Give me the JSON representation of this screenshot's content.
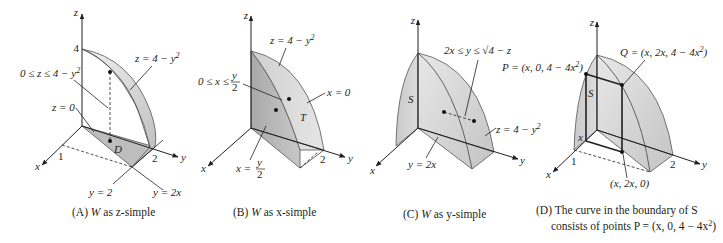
{
  "figure": {
    "panels": [
      {
        "id": "A",
        "caption_prefix": "(A) ",
        "caption_W": "W",
        "caption_rest": " as z-simple",
        "axes": {
          "z": "z",
          "y": "y",
          "x": "x"
        },
        "ticks": {
          "z4": "4",
          "x1": "1",
          "y2": "2"
        },
        "labels": {
          "surface_top": "z = 4 − y",
          "surface_top_exp": "2",
          "range": "0 ≤ z ≤ 4 − y",
          "range_exp": "2",
          "floor": "z = 0",
          "region": "D",
          "line_y2": "y = 2",
          "line_y2x": "y = 2x"
        }
      },
      {
        "id": "B",
        "caption_prefix": "(B) ",
        "caption_W": "W",
        "caption_rest": " as x-simple",
        "axes": {
          "z": "z",
          "y": "y",
          "x": "x"
        },
        "ticks": {
          "y2": "2"
        },
        "labels": {
          "surface_top": "z = 4 − y",
          "surface_top_exp": "2",
          "range_left": "0 ≤ x ≤ ",
          "range_frac_num": "y",
          "range_frac_den": "2",
          "plane_x0": "x = 0",
          "region": "T",
          "plane_left": "x = ",
          "plane_frac_num": "y",
          "plane_frac_den": "2"
        }
      },
      {
        "id": "C",
        "caption_prefix": "(C) ",
        "caption_W": "W",
        "caption_rest": " as y-simple",
        "axes": {
          "z": "z",
          "y": "y",
          "x": "x"
        },
        "labels": {
          "range": "2x ≤ y ≤ √4 − z",
          "region": "S",
          "surface": "z = 4 − y",
          "surface_exp": "2",
          "plane": "y = 2x"
        }
      },
      {
        "id": "D",
        "caption_line1": "(D) The curve in the boundary of S",
        "caption_line2": "consists of points P = (x, 0, 4 − 4x",
        "caption_line2_exp": "2",
        "caption_line2_end": ")",
        "axes": {
          "z": "z",
          "y": "y",
          "x": "x"
        },
        "ticks": {
          "x1": "1",
          "y2": "2",
          "xmark": "x"
        },
        "labels": {
          "P": "P = (x, 0, 4 − 4x",
          "P_exp": "2",
          "P_end": ")",
          "Q": "Q = (x, 2x, 4 − 4x",
          "Q_exp": "2",
          "Q_end": ")",
          "base": "(x, 2x, 0)",
          "region": "S"
        }
      }
    ]
  },
  "colors": {
    "surface_light": "#e4e4e4",
    "surface_mid": "#cfcfcf",
    "surface_dark": "#b5b5b5",
    "ink": "#231f20"
  }
}
